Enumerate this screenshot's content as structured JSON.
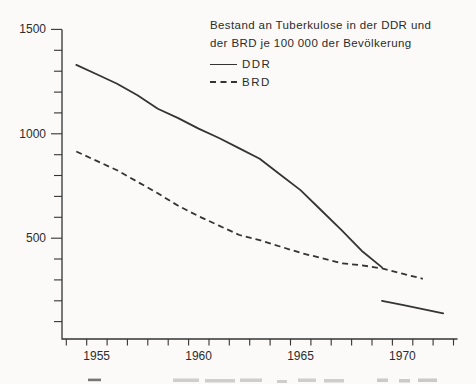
{
  "chart_data": {
    "type": "line",
    "title": "Bestand an Tuberkulose in der DDR und der BRD je 100 000 der Bevölkerung",
    "title_lines": [
      "Bestand an Tuberkulose in der DDR und",
      "der BRD je 100 000 der Bevölkerung"
    ],
    "xlabel": "",
    "ylabel": "",
    "x_axis": {
      "tick_labels": [
        "1955",
        "1960",
        "1965",
        "1970"
      ],
      "minor_tick_every_years": 1,
      "range_years": [
        1953.5,
        1972.5
      ]
    },
    "y_axis": {
      "tick_labels": [
        "1500",
        "1000",
        "500"
      ],
      "minor_tick_every": 100,
      "range": [
        0,
        1500
      ]
    },
    "legend": [
      {
        "label": "DDR",
        "line_style": "solid"
      },
      {
        "label": "BRD",
        "line_style": "dashed"
      }
    ],
    "legend_position": "top-right",
    "grid": false,
    "series": [
      {
        "name": "DDR",
        "segment": 1,
        "line_style": "solid",
        "x": [
          1954,
          1955,
          1956,
          1957,
          1958,
          1959,
          1960,
          1961,
          1962,
          1963,
          1964,
          1965,
          1966,
          1967,
          1968,
          1969
        ],
        "values": [
          1330,
          1285,
          1240,
          1185,
          1120,
          1075,
          1025,
          980,
          930,
          880,
          805,
          730,
          635,
          540,
          440,
          360
        ]
      },
      {
        "name": "DDR",
        "segment": 2,
        "line_style": "solid",
        "x": [
          1969,
          1970,
          1971,
          1972
        ],
        "values": [
          200,
          180,
          160,
          140
        ]
      },
      {
        "name": "BRD",
        "segment": 1,
        "line_style": "dashed",
        "x": [
          1954,
          1955,
          1956,
          1957,
          1958,
          1959,
          1960,
          1961,
          1962,
          1963,
          1964,
          1965,
          1966,
          1967,
          1968,
          1969,
          1970,
          1971
        ],
        "values": [
          915,
          870,
          825,
          770,
          715,
          655,
          605,
          560,
          515,
          490,
          460,
          430,
          405,
          380,
          370,
          355,
          330,
          305
        ]
      }
    ],
    "colors": {
      "line": "#343434",
      "text": "#2c2c2c",
      "background": "#fbfaf8"
    },
    "footer_note": "illegible caption line cut off at bottom edge of scan"
  }
}
